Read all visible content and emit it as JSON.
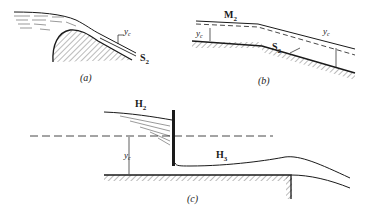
{
  "figure": {
    "panels": [
      {
        "id": "a",
        "caption": "(a)",
        "labels": {
          "depth": "y",
          "depth_sub": "c",
          "profile": "S",
          "profile_sub": "2"
        },
        "description": "Flow over a rounded weir crest transitioning to steep slope"
      },
      {
        "id": "b",
        "caption": "(b)",
        "labels": {
          "upstream_profile": "M",
          "upstream_profile_sub": "2",
          "upstream_depth": "y",
          "upstream_depth_sub": "c",
          "downstream_profile": "S",
          "downstream_profile_sub": "2",
          "downstream_depth": "y",
          "downstream_depth_sub": "c"
        },
        "description": "Mild slope to steep slope transition"
      },
      {
        "id": "c",
        "caption": "(c)",
        "labels": {
          "upstream_profile": "H",
          "upstream_profile_sub": "2",
          "depth": "y",
          "depth_sub": "c",
          "downstream_profile": "H",
          "downstream_profile_sub": "3"
        },
        "description": "Sluice gate on horizontal channel with free overfall"
      }
    ],
    "colors": {
      "ink": "#1a1a1a",
      "hatch": "#555555",
      "background": "#ffffff"
    }
  }
}
